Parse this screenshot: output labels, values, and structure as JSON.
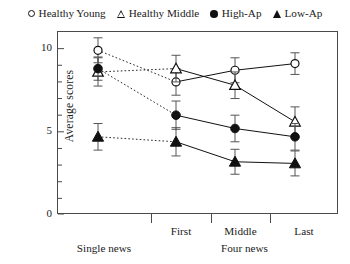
{
  "legend": {
    "items": [
      {
        "label": "Healthy Young",
        "marker": "open-circle",
        "icon": "circle-outline-icon"
      },
      {
        "label": "Healthy Middle",
        "marker": "open-triangle",
        "icon": "triangle-outline-icon"
      },
      {
        "label": "High-Ap",
        "marker": "filled-circle",
        "icon": "circle-filled-icon"
      },
      {
        "label": "Low-Ap",
        "marker": "filled-triangle",
        "icon": "triangle-filled-icon"
      }
    ]
  },
  "axes": {
    "y_label": "Average scores",
    "y_ticks": [
      "0",
      "5",
      "10"
    ],
    "x_categories": [
      "Single news",
      "First",
      "Middle",
      "Last"
    ],
    "x_group_label": "Four news"
  },
  "chart_data": {
    "type": "line",
    "title": "",
    "xlabel": "",
    "ylabel": "Average scores",
    "ylim": [
      0,
      11
    ],
    "yticks": [
      0,
      5,
      10
    ],
    "yminor_step": 1,
    "grid": false,
    "legend_position": "top-center",
    "x": [
      "Single news",
      "First",
      "Middle",
      "Last"
    ],
    "series": [
      {
        "name": "Healthy Young",
        "marker": "open-circle",
        "line": "dotted-then-solid",
        "values": [
          9.9,
          8.0,
          8.7,
          9.1
        ],
        "errors": [
          0.75,
          0.8,
          0.75,
          0.65
        ]
      },
      {
        "name": "Healthy Middle",
        "marker": "open-triangle",
        "line": "dotted-then-solid",
        "values": [
          8.6,
          8.8,
          7.8,
          5.6
        ],
        "errors": [
          0.85,
          0.8,
          0.8,
          0.9
        ]
      },
      {
        "name": "High-Ap",
        "marker": "filled-circle",
        "line": "dotted-then-solid",
        "values": [
          8.8,
          6.0,
          5.2,
          4.7
        ],
        "errors": [
          0.7,
          0.85,
          0.8,
          0.8
        ]
      },
      {
        "name": "Low-Ap",
        "marker": "filled-triangle",
        "line": "dotted-then-solid",
        "values": [
          4.7,
          4.4,
          3.2,
          3.1
        ],
        "errors": [
          0.8,
          0.85,
          0.75,
          0.75
        ]
      }
    ],
    "annotations": {
      "group_bracket": "Four news covering First, Middle, Last",
      "single_group": "Single news"
    }
  },
  "colors": {
    "ink": "#111111",
    "axis": "#4a4a4a",
    "background": "#ffffff"
  }
}
